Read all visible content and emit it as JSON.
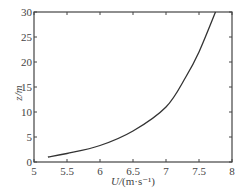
{
  "chart_data": {
    "type": "line",
    "title": "",
    "xlabel": "U/(m·s⁻¹)",
    "ylabel": "z/m",
    "xlim": [
      5,
      8
    ],
    "ylim": [
      0,
      30
    ],
    "xticks": [
      "5",
      "5.5",
      "6",
      "6.5",
      "7",
      "7.5",
      "8"
    ],
    "yticks": [
      "0",
      "5",
      "10",
      "15",
      "20",
      "25",
      "30"
    ],
    "grid": false,
    "legend": null,
    "series": [
      {
        "name": "wind profile",
        "x": [
          5.21,
          5.5,
          6.0,
          6.5,
          7.0,
          7.3,
          7.5,
          7.75
        ],
        "y": [
          1,
          1.7,
          3.3,
          6.2,
          11,
          17,
          22,
          30
        ]
      }
    ]
  },
  "labels": {
    "xlabel_main": "U/",
    "xlabel_unit": "(m·s⁻¹)",
    "ylabel": "z/m"
  }
}
